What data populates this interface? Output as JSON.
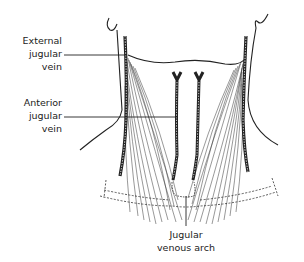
{
  "diagram": {
    "labels": {
      "external_jugular_vein": {
        "line1": "External",
        "line2": "jugular",
        "line3": "vein"
      },
      "anterior_jugular_vein": {
        "line1": "Anterior",
        "line2": "jugular",
        "line3": "vein"
      },
      "jugular_venous_arch": {
        "line1": "Jugular",
        "line2": "venous arch"
      }
    },
    "colors": {
      "ink": "#222222",
      "background": "#ffffff"
    }
  }
}
